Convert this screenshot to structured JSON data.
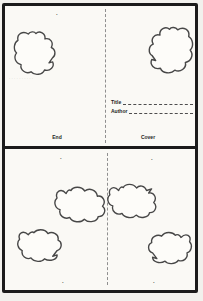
{
  "colors": {
    "ink": "#1b1b1b",
    "paper": "#faf9f5",
    "cloud_stroke": "#474747",
    "fold_line": "#8f8f8f"
  },
  "cover_page": {
    "title_label": "Title",
    "author_label": "Author"
  },
  "top_panel": {
    "top_page_mark": "·",
    "dots_row": "··········",
    "left_footer_label": "End",
    "right_footer_label": "Cover"
  },
  "bottom_panel": {
    "corner_marks": [
      "·",
      "·",
      "·",
      "·"
    ]
  }
}
